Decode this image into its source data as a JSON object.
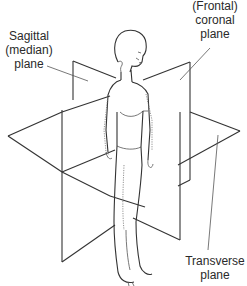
{
  "diagram": {
    "labels": {
      "sagittal": {
        "line1": "Sagittal",
        "line2": "(median)",
        "line3": "plane"
      },
      "coronal": {
        "line1": "(Frontal)",
        "line2": "coronal",
        "line3": "plane"
      },
      "transverse": {
        "line1": "Transverse",
        "line2": "plane"
      }
    },
    "colors": {
      "stroke": "#333333",
      "text": "#2a2a2a",
      "background": "#ffffff"
    }
  }
}
